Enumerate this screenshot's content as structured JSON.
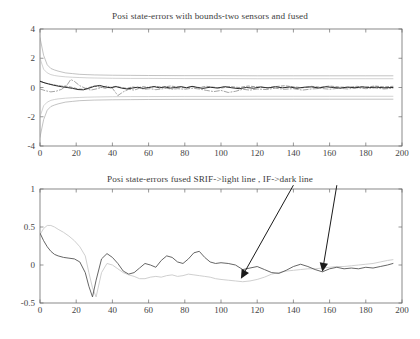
{
  "figure": {
    "width": 420,
    "height": 339,
    "background": "#ffffff",
    "panel_count": 2
  },
  "chart_data": [
    {
      "id": "top",
      "type": "line",
      "title": "Posi state-errors with bounds-two sensors and fused",
      "xlabel": "",
      "ylabel": "",
      "xlim": [
        0,
        200
      ],
      "ylim": [
        -4,
        4
      ],
      "xticks": [
        0,
        20,
        40,
        60,
        80,
        100,
        120,
        140,
        160,
        180,
        200
      ],
      "yticks": [
        -4,
        -2,
        0,
        2,
        4
      ],
      "xticklabels": [
        "0",
        "20",
        "40",
        "60",
        "80",
        "100",
        "120",
        "140",
        "160",
        "180",
        "200"
      ],
      "yticklabels": [
        "-4",
        "-2",
        "0",
        "2",
        "4"
      ],
      "grid": false,
      "legend": null,
      "series": [
        {
          "name": "sensor-1 upper bound",
          "style": "solid",
          "color": "#9a9a9a",
          "width": 0.6,
          "x": [
            0,
            2,
            4,
            6,
            8,
            10,
            14,
            18,
            22,
            26,
            30,
            40,
            50,
            60,
            80,
            100,
            120,
            140,
            160,
            180,
            195
          ],
          "values": [
            3.4,
            2.2,
            1.55,
            1.3,
            1.2,
            1.12,
            1.0,
            0.95,
            0.9,
            0.88,
            0.86,
            0.84,
            0.83,
            0.82,
            0.81,
            0.81,
            0.8,
            0.8,
            0.8,
            0.8,
            0.8
          ]
        },
        {
          "name": "sensor-1 lower bound",
          "style": "solid",
          "color": "#9a9a9a",
          "width": 0.6,
          "x": [
            0,
            2,
            4,
            6,
            8,
            10,
            14,
            18,
            22,
            26,
            30,
            40,
            50,
            60,
            80,
            100,
            120,
            140,
            160,
            180,
            195
          ],
          "values": [
            -3.4,
            -2.2,
            -1.55,
            -1.3,
            -1.2,
            -1.12,
            -1.0,
            -0.95,
            -0.9,
            -0.88,
            -0.86,
            -0.84,
            -0.83,
            -0.82,
            -0.81,
            -0.81,
            -0.8,
            -0.8,
            -0.8,
            -0.8,
            -0.8
          ]
        },
        {
          "name": "fused upper bound",
          "style": "solid",
          "color": "#b4b4b4",
          "width": 0.6,
          "x": [
            0,
            2,
            4,
            6,
            8,
            10,
            14,
            18,
            22,
            26,
            30,
            40,
            50,
            60,
            80,
            100,
            120,
            140,
            160,
            180,
            195
          ],
          "values": [
            2.0,
            1.25,
            1.0,
            0.88,
            0.82,
            0.78,
            0.73,
            0.7,
            0.68,
            0.66,
            0.65,
            0.63,
            0.62,
            0.62,
            0.61,
            0.61,
            0.6,
            0.6,
            0.6,
            0.6,
            0.6
          ]
        },
        {
          "name": "fused lower bound",
          "style": "solid",
          "color": "#b4b4b4",
          "width": 0.6,
          "x": [
            0,
            2,
            4,
            6,
            8,
            10,
            14,
            18,
            22,
            26,
            30,
            40,
            50,
            60,
            80,
            100,
            120,
            140,
            160,
            180,
            195
          ],
          "values": [
            -2.0,
            -1.25,
            -1.0,
            -0.88,
            -0.82,
            -0.78,
            -0.73,
            -0.7,
            -0.68,
            -0.66,
            -0.65,
            -0.63,
            -0.62,
            -0.62,
            -0.61,
            -0.61,
            -0.6,
            -0.6,
            -0.6,
            -0.6,
            -0.6
          ]
        },
        {
          "name": "sensor-1 error",
          "style": "dashdot",
          "color": "#7c7c7c",
          "width": 0.7,
          "x": [
            0,
            3,
            6,
            9,
            12,
            15,
            17,
            19,
            22,
            25,
            28,
            31,
            34,
            37,
            40,
            43,
            46,
            49,
            52,
            55,
            58,
            61,
            64,
            67,
            70,
            73,
            76,
            80,
            84,
            88,
            92,
            96,
            100,
            104,
            108,
            112,
            116,
            120,
            125,
            130,
            135,
            140,
            145,
            150,
            155,
            160,
            165,
            170,
            175,
            180,
            185,
            190,
            195
          ],
          "values": [
            -0.1,
            -0.22,
            -0.3,
            -0.25,
            -0.12,
            0.18,
            0.55,
            0.42,
            0.12,
            -0.05,
            -0.18,
            -0.1,
            0.0,
            0.1,
            -0.05,
            -0.55,
            -0.3,
            -0.12,
            -0.18,
            -0.05,
            -0.12,
            -0.08,
            -0.15,
            -0.1,
            -0.05,
            -0.12,
            -0.08,
            -0.12,
            -0.05,
            -0.1,
            -0.2,
            -0.28,
            -0.2,
            -0.34,
            -0.26,
            -0.12,
            -0.18,
            -0.1,
            -0.14,
            -0.05,
            -0.12,
            -0.08,
            -0.18,
            -0.1,
            -0.06,
            -0.12,
            -0.05,
            -0.1,
            -0.02,
            -0.08,
            -0.03,
            -0.1,
            -0.05
          ]
        },
        {
          "name": "sensor-2 error",
          "style": "dashed",
          "color": "#6d6d6d",
          "width": 0.7,
          "x": [
            0,
            3,
            6,
            9,
            12,
            15,
            18,
            21,
            24,
            27,
            30,
            33,
            36,
            39,
            42,
            45,
            48,
            51,
            54,
            57,
            60,
            64,
            68,
            72,
            76,
            80,
            84,
            88,
            92,
            96,
            100,
            105,
            110,
            115,
            120,
            125,
            130,
            135,
            140,
            145,
            150,
            155,
            160,
            165,
            170,
            175,
            180,
            185,
            190,
            195
          ],
          "values": [
            0.45,
            0.3,
            0.22,
            0.15,
            0.1,
            0.08,
            0.0,
            -0.1,
            -0.12,
            0.0,
            0.1,
            0.04,
            -0.05,
            0.02,
            0.08,
            0.0,
            -0.06,
            0.04,
            -0.02,
            0.06,
            0.0,
            0.08,
            0.02,
            0.1,
            0.04,
            -0.02,
            0.06,
            0.0,
            0.08,
            0.02,
            -0.04,
            0.06,
            0.0,
            0.1,
            0.04,
            -0.02,
            0.06,
            0.12,
            0.05,
            -0.02,
            0.08,
            0.02,
            0.1,
            0.04,
            0.0,
            0.08,
            0.02,
            0.1,
            0.04,
            0.08
          ]
        },
        {
          "name": "fused error",
          "style": "solid",
          "color": "#2b2b2b",
          "width": 1.0,
          "x": [
            0,
            3,
            6,
            9,
            12,
            15,
            18,
            21,
            24,
            27,
            30,
            33,
            36,
            39,
            42,
            45,
            48,
            51,
            54,
            57,
            60,
            63,
            66,
            69,
            72,
            75,
            78,
            81,
            84,
            87,
            90,
            94,
            98,
            102,
            106,
            110,
            114,
            118,
            122,
            126,
            130,
            134,
            138,
            142,
            146,
            150,
            154,
            158,
            162,
            166,
            170,
            174,
            178,
            182,
            186,
            190,
            195
          ],
          "values": [
            0.42,
            0.3,
            0.2,
            0.12,
            0.05,
            0.0,
            -0.06,
            -0.14,
            -0.16,
            -0.05,
            0.08,
            0.14,
            0.04,
            -0.02,
            0.06,
            -0.04,
            -0.1,
            -0.04,
            0.02,
            -0.06,
            0.0,
            0.06,
            -0.02,
            0.04,
            -0.04,
            0.0,
            0.06,
            -0.02,
            0.08,
            0.0,
            -0.06,
            0.02,
            -0.04,
            0.06,
            -0.02,
            -0.08,
            0.0,
            -0.05,
            0.04,
            -0.03,
            0.05,
            -0.02,
            0.03,
            -0.05,
            0.02,
            0.04,
            -0.03,
            0.05,
            0.0,
            -0.04,
            0.03,
            -0.02,
            0.04,
            0.0,
            0.02,
            -0.02,
            0.0
          ]
        }
      ]
    },
    {
      "id": "bottom",
      "type": "line",
      "title": "Posi state-errors fused SRIF->light line , IF->dark line",
      "xlabel": "",
      "ylabel": "",
      "xlim": [
        0,
        200
      ],
      "ylim": [
        -0.5,
        1
      ],
      "xticks": [
        0,
        20,
        40,
        60,
        80,
        100,
        120,
        140,
        160,
        180,
        200
      ],
      "yticks": [
        -0.5,
        0,
        0.5,
        1
      ],
      "xticklabels": [
        "0",
        "20",
        "40",
        "60",
        "80",
        "100",
        "120",
        "140",
        "160",
        "180",
        "200"
      ],
      "yticklabels": [
        "-0.5",
        "0",
        "0.5",
        "1"
      ],
      "grid": false,
      "legend": null,
      "annotations": [
        {
          "name": "arrow-to-srif-light-line",
          "label": "",
          "from_xy": [
            140,
            1.05
          ],
          "to_xy": [
            111,
            -0.18
          ],
          "color": "#1a1a1a"
        },
        {
          "name": "arrow-to-if-dark-line",
          "label": "",
          "from_xy": [
            164,
            1.05
          ],
          "to_xy": [
            156,
            -0.09
          ],
          "color": "#1a1a1a"
        }
      ],
      "series": [
        {
          "name": "SRIF fused error (light line)",
          "style": "solid",
          "color": "#c9c9c9",
          "width": 0.9,
          "x": [
            0,
            2,
            4,
            6,
            8,
            10,
            13,
            16,
            19,
            22,
            25,
            27,
            29,
            31,
            34,
            37,
            40,
            43,
            46,
            49,
            52,
            55,
            58,
            61,
            64,
            67,
            70,
            73,
            76,
            79,
            82,
            85,
            88,
            91,
            94,
            97,
            100,
            104,
            108,
            112,
            116,
            120,
            124,
            128,
            132,
            136,
            140,
            144,
            148,
            152,
            156,
            160,
            164,
            168,
            172,
            176,
            180,
            184,
            188,
            192,
            195
          ],
          "values": [
            0.4,
            0.48,
            0.52,
            0.52,
            0.5,
            0.47,
            0.43,
            0.38,
            0.32,
            0.24,
            0.12,
            -0.1,
            -0.3,
            -0.42,
            -0.1,
            0.02,
            0.0,
            -0.05,
            -0.1,
            -0.13,
            -0.15,
            -0.18,
            -0.18,
            -0.16,
            -0.15,
            -0.16,
            -0.14,
            -0.13,
            -0.15,
            -0.14,
            -0.12,
            -0.13,
            -0.14,
            -0.15,
            -0.16,
            -0.18,
            -0.19,
            -0.2,
            -0.21,
            -0.22,
            -0.21,
            -0.19,
            -0.16,
            -0.12,
            -0.1,
            -0.08,
            -0.07,
            -0.06,
            -0.05,
            -0.05,
            -0.04,
            -0.03,
            -0.02,
            -0.02,
            -0.01,
            0.0,
            0.01,
            0.02,
            0.04,
            0.06,
            0.07
          ]
        },
        {
          "name": "IF fused error (dark line)",
          "style": "solid",
          "color": "#555555",
          "width": 0.9,
          "x": [
            0,
            2,
            4,
            6,
            8,
            10,
            13,
            16,
            19,
            22,
            25,
            27,
            29,
            31,
            34,
            37,
            40,
            43,
            46,
            49,
            52,
            55,
            58,
            61,
            64,
            67,
            70,
            73,
            76,
            79,
            82,
            85,
            88,
            91,
            94,
            97,
            100,
            104,
            108,
            112,
            116,
            120,
            124,
            128,
            132,
            136,
            140,
            144,
            148,
            152,
            156,
            160,
            164,
            168,
            172,
            176,
            180,
            184,
            188,
            192,
            195
          ],
          "values": [
            0.42,
            0.32,
            0.24,
            0.18,
            0.14,
            0.12,
            0.1,
            0.09,
            0.08,
            0.04,
            -0.1,
            -0.28,
            -0.42,
            -0.2,
            0.08,
            0.15,
            0.1,
            0.02,
            -0.08,
            -0.12,
            -0.1,
            -0.04,
            0.02,
            0.0,
            -0.03,
            0.06,
            0.12,
            0.1,
            0.04,
            0.02,
            0.08,
            0.16,
            0.18,
            0.1,
            0.04,
            0.02,
            0.03,
            0.02,
            0.0,
            -0.06,
            -0.04,
            -0.02,
            -0.06,
            -0.1,
            -0.11,
            -0.07,
            -0.02,
            0.01,
            -0.02,
            -0.06,
            -0.09,
            -0.05,
            -0.03,
            -0.05,
            -0.04,
            -0.05,
            -0.03,
            -0.04,
            -0.02,
            0.0,
            0.02
          ]
        }
      ]
    }
  ]
}
